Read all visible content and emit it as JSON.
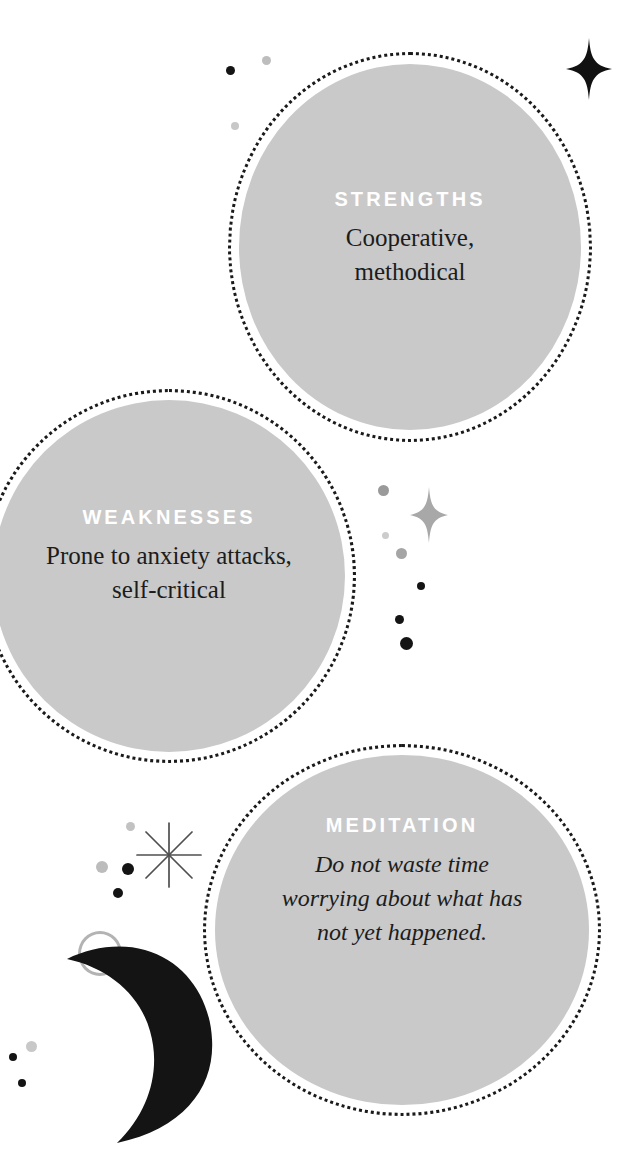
{
  "page": {
    "background_color": "#ffffff",
    "bubble_fill_color": "#c9c9c9",
    "bubble_ring_color": "#1a1a1a",
    "heading_color": "#ffffff",
    "body_color": "#1c1c1c"
  },
  "bubbles": [
    {
      "id": "strengths",
      "heading": "STRENGTHS",
      "body": "Cooperative,\nmethodical",
      "body_style": "roman"
    },
    {
      "id": "weaknesses",
      "heading": "WEAKNESSES",
      "body": "Prone to anxiety attacks,\nself-critical",
      "body_style": "roman"
    },
    {
      "id": "meditation",
      "heading": "MEDITATION",
      "body": "Do not waste time\nworrying about what has\nnot yet happened.",
      "body_style": "italic"
    }
  ],
  "decorations": {
    "sparkles": [
      {
        "name": "four-point-star-black",
        "color": "#111111"
      },
      {
        "name": "four-point-star-gray",
        "color": "#a8a8a8"
      }
    ],
    "moon": {
      "name": "crescent-moon",
      "color": "#141414"
    },
    "starburst": {
      "name": "eight-point-starburst",
      "color": "#5a5a5a"
    },
    "open_circle": {
      "name": "open-circle-outline",
      "color": "#b3b3b3"
    },
    "dot_colors": [
      "#141414",
      "#8f8f8f",
      "#c4c4c4",
      "#b0b0b0",
      "#d2d2d2"
    ]
  }
}
